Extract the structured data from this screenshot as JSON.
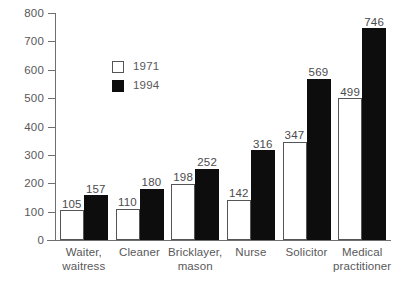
{
  "chart_data": {
    "type": "bar",
    "title": "",
    "subtitle": "",
    "xlabel": "",
    "ylabel": "",
    "ylim": [
      0,
      800
    ],
    "ytick_step": 100,
    "yticks": [
      "800",
      "700",
      "600",
      "500",
      "400",
      "300",
      "200",
      "100",
      "0"
    ],
    "grid": false,
    "legend_position": "upper-left-center",
    "categories": [
      "Waiter,\nwaitress",
      "Cleaner",
      "Bricklayer,\nmason",
      "Nurse",
      "Solicitor",
      "Medical\npractitioner"
    ],
    "category_lines": [
      [
        "Waiter,",
        "waitress"
      ],
      [
        "Cleaner",
        ""
      ],
      [
        "Bricklayer,",
        "mason"
      ],
      [
        "Nurse",
        ""
      ],
      [
        "Solicitor",
        ""
      ],
      [
        "Medical",
        "practitioner"
      ]
    ],
    "series": [
      {
        "name": "1971",
        "color": "#ffffff",
        "values": [
          105,
          110,
          198,
          142,
          347,
          499
        ]
      },
      {
        "name": "1994",
        "color": "#0d0d0d",
        "values": [
          157,
          180,
          252,
          316,
          569,
          746
        ]
      }
    ]
  },
  "legend": {
    "items": [
      {
        "label": "1971",
        "swatch": "white"
      },
      {
        "label": "1994",
        "swatch": "black"
      }
    ]
  }
}
